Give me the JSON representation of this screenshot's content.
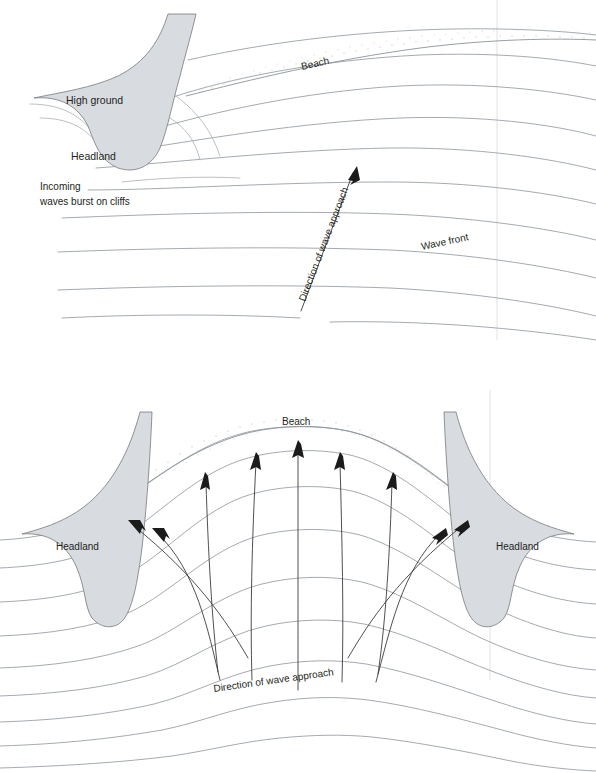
{
  "figure": {
    "background_color": "#ffffff",
    "land_fill": "#d8dce0",
    "wave_stroke": "#9aa0a6",
    "arrow_stroke": "#3c3c3c",
    "text_color": "#231f20"
  },
  "panels": [
    {
      "id": "top",
      "name": "oblique-wave-approach",
      "labels": {
        "high_ground": "High ground",
        "headland": "Headland",
        "incoming_line1": "Incoming",
        "incoming_line2": "waves burst on cliffs",
        "beach": "Beach",
        "wave_front": "Wave front",
        "direction": "Direction of wave approach"
      },
      "wave_front_count": 9,
      "arrow_count": 1
    },
    {
      "id": "bottom",
      "name": "bay-and-two-headlands",
      "labels": {
        "headland_left": "Headland",
        "headland_right": "Headland",
        "beach": "Beach",
        "direction": "Direction of wave approach"
      },
      "wave_front_count": 9,
      "arrow_count": 9
    }
  ],
  "legend_items": [
    {
      "key": "land",
      "label": "High ground"
    },
    {
      "key": "headland",
      "label": "Headland"
    },
    {
      "key": "beach",
      "label": "Beach"
    },
    {
      "key": "wave_front",
      "label": "Wave front"
    },
    {
      "key": "orthogonal",
      "label": "Direction of wave approach"
    },
    {
      "key": "cliff_note",
      "label": "Incoming waves burst on cliffs"
    }
  ]
}
